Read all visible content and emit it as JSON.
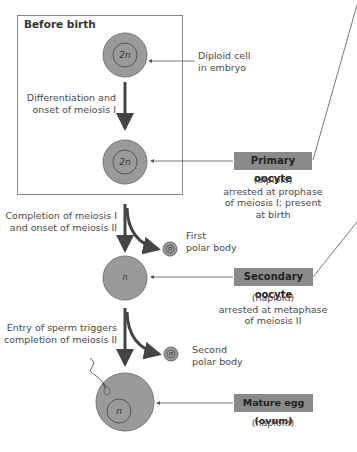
{
  "box": {
    "title": "Before birth"
  },
  "cells": {
    "diploid_label": "2n",
    "haploid_label": "n"
  },
  "labels": {
    "diploid_cell": [
      "Diploid cell",
      "in embryo"
    ],
    "differentiation": [
      "Differentiation and",
      "onset of meiosis I"
    ],
    "completion1": [
      "Completion of meiosis I",
      "and onset of meiosis II"
    ],
    "first_polar": [
      "First",
      "polar body"
    ],
    "entry_sperm": [
      "Entry of sperm triggers",
      "completion of meiosis II"
    ],
    "second_polar": [
      "Second",
      "polar body"
    ]
  },
  "tags": {
    "primary": {
      "title": "Primary oocyte",
      "desc": [
        "(diploid)",
        "arrested at prophase",
        "of meiosis I; present",
        "at birth"
      ]
    },
    "secondary": {
      "title": "Secondary oocyte",
      "desc": [
        "(haploid)",
        "arrested at metaphase",
        "of meiosis II"
      ]
    },
    "mature": {
      "title": "Mature egg (ovum)",
      "desc": [
        "(haploid)"
      ]
    }
  },
  "colors": {
    "cell_fill": "#9a9a9a",
    "tag_fill": "#8a8a8a",
    "arrow": "#444444"
  }
}
